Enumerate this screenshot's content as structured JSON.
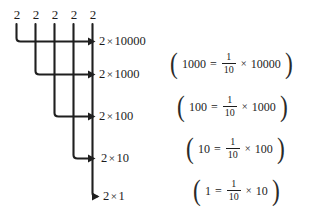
{
  "figure": {
    "digits": [
      {
        "value": "2",
        "x": 11,
        "y": 8
      },
      {
        "value": "2",
        "x": 31,
        "y": 8
      },
      {
        "value": "2",
        "x": 51,
        "y": 8
      },
      {
        "value": "2",
        "x": 70,
        "y": 8
      },
      {
        "value": "2",
        "x": 89,
        "y": 8
      }
    ],
    "branches": [
      {
        "coefficient": "2",
        "times": "×",
        "place": "10000",
        "x": 93,
        "y": 35
      },
      {
        "coefficient": "2",
        "times": "×",
        "place": "1000",
        "x": 93,
        "y": 68
      },
      {
        "coefficient": "2",
        "times": "×",
        "place": "100",
        "x": 93,
        "y": 110
      },
      {
        "coefficient": "2",
        "times": "×",
        "place": "10",
        "x": 93,
        "y": 152
      },
      {
        "coefficient": "2",
        "times": "×",
        "place": "1",
        "x": 93,
        "y": 190
      }
    ],
    "equations": [
      {
        "left": "1000",
        "op": "=",
        "num": "1",
        "den": "10",
        "times": "×",
        "right": "10000",
        "open": "(",
        "close": ")",
        "x": 169,
        "y": 53
      },
      {
        "left": "100",
        "op": "=",
        "num": "1",
        "den": "10",
        "times": "×",
        "right": "1000",
        "open": "(",
        "close": ")",
        "x": 176,
        "y": 96
      },
      {
        "left": "10",
        "op": "=",
        "num": "1",
        "den": "10",
        "times": "×",
        "right": "100",
        "open": "(",
        "close": ")",
        "x": 185,
        "y": 138
      },
      {
        "left": "1",
        "op": "=",
        "num": "1",
        "den": "10",
        "times": "×",
        "right": "10",
        "open": "(",
        "close": ")",
        "x": 192,
        "y": 180
      }
    ],
    "colors": {
      "ink": "#1c1c1c",
      "line": "#1f1f1f",
      "background": "#ffffff"
    }
  }
}
